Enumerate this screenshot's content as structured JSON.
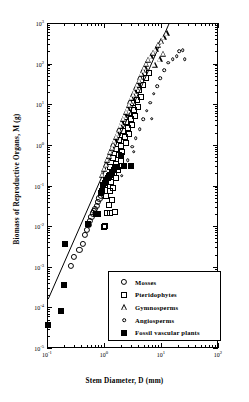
{
  "chart_data": {
    "type": "scatter",
    "title": "",
    "xlabel": "Stem Diameter, D (mm)",
    "ylabel": "Biomass of Reproductive Organs, M (g)",
    "xscale": "log",
    "yscale": "log",
    "xlim": [
      0.1,
      100
    ],
    "ylim": [
      1e-05,
      1000
    ],
    "xticks": [
      "10-1",
      "100",
      "101",
      "102"
    ],
    "xtick_labels": [
      "10",
      "10",
      "10",
      "10"
    ],
    "xtick_exponents": [
      "-1",
      "0",
      "1",
      "2"
    ],
    "ytick_labels": [
      "10",
      "10",
      "10",
      "10",
      "10",
      "10",
      "10",
      "10",
      "10"
    ],
    "ytick_exponents": [
      "3",
      "2",
      "1",
      "0",
      "-1",
      "-2",
      "-3",
      "-4",
      "-5"
    ],
    "grid": false,
    "legend_position": "bottom-right",
    "legend_entries": [
      {
        "label": "Mosses",
        "marker": "open-circle-large"
      },
      {
        "label": "Pteridophytes",
        "marker": "open-square"
      },
      {
        "label": "Gymnosperms",
        "marker": "open-triangle"
      },
      {
        "label": "Angiosperms",
        "marker": "open-circle-small"
      },
      {
        "label": "Fossil vascular plants",
        "marker": "filled-square"
      }
    ],
    "fit_line": {
      "x": [
        0.105,
        14.0
      ],
      "y": [
        0.00016,
        1000
      ]
    },
    "series": [
      {
        "name": "Mosses",
        "marker": "open-circle-large",
        "points": [
          [
            0.26,
            0.00105
          ],
          [
            0.3,
            0.00175
          ],
          [
            0.37,
            0.0026
          ],
          [
            0.42,
            0.0036
          ],
          [
            0.47,
            0.006
          ],
          [
            0.5,
            0.0082
          ],
          [
            0.54,
            0.0105
          ],
          [
            0.57,
            0.0135
          ],
          [
            0.6,
            0.0165
          ],
          [
            0.63,
            0.0205
          ],
          [
            0.66,
            0.024
          ],
          [
            0.7,
            0.0265
          ],
          [
            0.74,
            0.032
          ],
          [
            0.78,
            0.04
          ],
          [
            0.83,
            0.048
          ],
          [
            0.88,
            0.056
          ],
          [
            0.93,
            0.065
          ]
        ]
      },
      {
        "name": "Pteridophytes",
        "marker": "open-square",
        "points": [
          [
            1.0,
            0.0095
          ],
          [
            1.05,
            0.0098
          ],
          [
            1.15,
            0.021
          ],
          [
            1.3,
            0.0215
          ],
          [
            1.55,
            0.022
          ],
          [
            1.2,
            0.034
          ],
          [
            1.4,
            0.043
          ],
          [
            1.1,
            0.056
          ],
          [
            1.25,
            0.072
          ],
          [
            1.45,
            0.085
          ],
          [
            1.05,
            0.105
          ],
          [
            1.35,
            0.125
          ],
          [
            1.6,
            0.15
          ],
          [
            1.2,
            0.175
          ],
          [
            1.5,
            0.205
          ],
          [
            1.75,
            0.245
          ],
          [
            1.3,
            0.29
          ],
          [
            1.65,
            0.34
          ],
          [
            1.95,
            0.4
          ],
          [
            1.45,
            0.47
          ],
          [
            1.8,
            0.56
          ],
          [
            2.1,
            0.66
          ],
          [
            1.6,
            0.78
          ],
          [
            2.0,
            0.92
          ],
          [
            2.4,
            1.1
          ],
          [
            1.85,
            1.3
          ],
          [
            2.3,
            1.55
          ],
          [
            2.75,
            1.85
          ],
          [
            2.15,
            2.2
          ],
          [
            2.6,
            2.6
          ],
          [
            3.1,
            3.1
          ],
          [
            2.45,
            3.7
          ],
          [
            2.95,
            4.4
          ],
          [
            3.5,
            5.2
          ],
          [
            2.8,
            6.2
          ],
          [
            3.35,
            7.4
          ],
          [
            3.95,
            8.8
          ],
          [
            3.2,
            10.5
          ],
          [
            3.8,
            12.5
          ],
          [
            4.5,
            15.0
          ],
          [
            4.05,
            22.0
          ],
          [
            4.8,
            30.0
          ],
          [
            5.4,
            45.0
          ],
          [
            6.2,
            60.0
          ]
        ]
      },
      {
        "name": "Gymnosperms",
        "marker": "open-triangle",
        "points": [
          [
            0.92,
            0.185
          ],
          [
            1.0,
            0.26
          ],
          [
            1.08,
            0.34
          ],
          [
            1.15,
            0.43
          ],
          [
            1.22,
            0.54
          ],
          [
            1.3,
            0.68
          ],
          [
            1.38,
            0.85
          ],
          [
            1.46,
            1.05
          ],
          [
            1.55,
            1.3
          ],
          [
            1.64,
            1.6
          ],
          [
            1.74,
            1.95
          ],
          [
            1.84,
            2.4
          ],
          [
            1.95,
            2.95
          ],
          [
            2.06,
            3.6
          ],
          [
            2.18,
            4.4
          ],
          [
            2.31,
            5.4
          ],
          [
            2.45,
            6.6
          ],
          [
            2.59,
            8.0
          ],
          [
            2.75,
            9.8
          ],
          [
            2.91,
            12.0
          ],
          [
            3.08,
            14.5
          ],
          [
            3.26,
            17.5
          ],
          [
            3.46,
            21.0
          ],
          [
            3.66,
            26.0
          ],
          [
            3.88,
            31.0
          ],
          [
            4.11,
            38.0
          ],
          [
            4.35,
            46.0
          ],
          [
            4.61,
            56.0
          ],
          [
            4.88,
            68.0
          ],
          [
            5.17,
            82.0
          ],
          [
            5.48,
            100.0
          ],
          [
            6.0,
            125.0
          ],
          [
            6.6,
            150.0
          ],
          [
            7.3,
            185.0
          ],
          [
            8.1,
            230.0
          ],
          [
            9.0,
            290.0
          ],
          [
            10.0,
            360.0
          ],
          [
            11.2,
            450.0
          ],
          [
            12.5,
            560.0
          ],
          [
            9.5,
            130.0
          ],
          [
            11.0,
            175.0
          ],
          [
            7.8,
            95.0
          ]
        ]
      },
      {
        "name": "Angiosperms",
        "marker": "open-circle-small",
        "points": [
          [
            2.05,
            0.175
          ],
          [
            2.6,
            0.42
          ],
          [
            3.1,
            0.9
          ],
          [
            3.6,
            1.45
          ],
          [
            4.2,
            2.4
          ],
          [
            4.9,
            4.3
          ],
          [
            5.6,
            7.0
          ],
          [
            6.4,
            11.0
          ],
          [
            7.4,
            18.0
          ],
          [
            8.5,
            28.0
          ],
          [
            9.8,
            44.0
          ],
          [
            11.5,
            68.0
          ],
          [
            13.5,
            105.0
          ],
          [
            16.0,
            130.0
          ],
          [
            19.0,
            150.0
          ],
          [
            21.0,
            200.0
          ],
          [
            24.0,
            215.0
          ],
          [
            26.0,
            130.0
          ],
          [
            6.9,
            4.4
          ],
          [
            3.3,
            0.68
          ]
        ]
      },
      {
        "name": "Fossil vascular plants",
        "marker": "filled-square",
        "points": [
          [
            0.105,
            3.6e-05
          ],
          [
            0.175,
            8.2e-05
          ],
          [
            0.2,
            0.00036
          ],
          [
            0.205,
            0.0037
          ],
          [
            0.52,
            0.0115
          ],
          [
            0.72,
            0.0195
          ],
          [
            0.8,
            0.02
          ],
          [
            0.88,
            0.064
          ],
          [
            0.94,
            0.074
          ],
          [
            0.98,
            0.105
          ],
          [
            1.03,
            0.118
          ],
          [
            1.1,
            0.135
          ],
          [
            1.18,
            0.152
          ],
          [
            1.26,
            0.178
          ],
          [
            1.36,
            0.205
          ],
          [
            1.5,
            0.245
          ],
          [
            1.7,
            0.29
          ],
          [
            2.95,
            0.31
          ],
          [
            1.95,
            0.54
          ],
          [
            2.2,
            0.31
          ]
        ]
      }
    ]
  }
}
